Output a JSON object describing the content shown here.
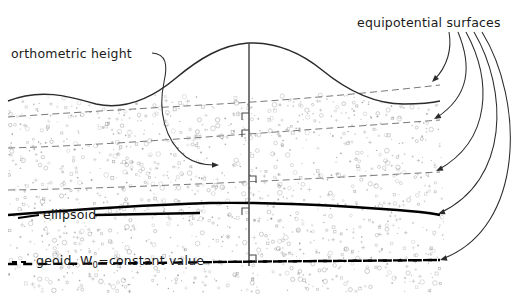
{
  "figure": {
    "kind": "geodesy-height-systems-diagram",
    "background_color": "#ffffff",
    "width": 531,
    "height": 296
  },
  "labels": {
    "equipotential": "equipotential surfaces",
    "orthometric": "orthometric height",
    "ellipsoid": "ellipsoid",
    "geoid_prefix": "geoid, W",
    "geoid_subscript": "0",
    "geoid_suffix": "=constant value"
  },
  "colors": {
    "terrain_stroke": "#2b2b2b",
    "equipotential_stroke": "#7a7a7a",
    "ellipsoid_stroke": "#000000",
    "geoid_stroke": "#000000",
    "leader_stroke": "#2b2b2b",
    "plumb_stroke": "#4a4a4a",
    "stipple": "#9a9a9a",
    "text": "#1a1a1a"
  },
  "surfaces": {
    "terrain_profile": "M 8,101 C 40,88 68,96 96,104 C 124,110 150,100 176,78 C 200,58 222,45 248,43 C 276,42 300,52 322,70 C 350,93 378,104 404,104 C 420,104 432,103 440,101",
    "equipotential_1": "M 8,117 C 80,112 150,108 220,104 C 290,100 360,94 440,85",
    "equipotential_2": "M 8,148 C 80,146 150,141 220,136 C 290,131 360,126 440,120",
    "equipotential_3": "M 8,190 C 80,189 150,186 220,183 C 290,180 360,176 440,172",
    "ellipsoid_path": "M 8,215 C 70,210 140,205 210,203 C 280,202 350,206 420,212 C 430,213 436,214 440,215",
    "geoid_path": "M 8,264 C 80,264 150,263 220,262 C 290,261 360,261 440,260",
    "plumb_line": "M 249,43 L 249,266"
  },
  "plumb_markers": [
    {
      "x": 249,
      "y": 120,
      "side": "left"
    },
    {
      "x": 249,
      "y": 137,
      "side": "left"
    },
    {
      "x": 249,
      "y": 183,
      "side": "right"
    },
    {
      "x": 249,
      "y": 215,
      "side": "left"
    },
    {
      "x": 249,
      "y": 262,
      "side": "right"
    }
  ],
  "leaders": [
    {
      "name": "equipotential-leader-1",
      "path": "M 449,32 C 452,48 448,66 434,80",
      "arrow_at": [
        432,
        82
      ],
      "angle": 135
    },
    {
      "name": "equipotential-leader-2",
      "path": "M 458,32 C 472,66 470,96 436,118",
      "arrow_at": [
        434,
        119
      ],
      "angle": 150
    },
    {
      "name": "equipotential-leader-3",
      "path": "M 466,32 C 492,80 492,140 438,170",
      "arrow_at": [
        436,
        171
      ],
      "angle": 155
    },
    {
      "name": "equipotential-leader-4",
      "path": "M 474,32 C 508,90 510,180 440,213",
      "arrow_at": [
        438,
        214
      ],
      "angle": 160
    },
    {
      "name": "equipotential-leader-5",
      "path": "M 482,32 C 524,100 526,228 442,259",
      "arrow_at": [
        440,
        260
      ],
      "angle": 163
    },
    {
      "name": "orthometric-leader",
      "path": "M 152,53 C 166,54 168,64 164,82 C 158,110 164,140 186,157 C 196,164 206,165 214,165",
      "arrow_at": [
        219,
        165
      ],
      "angle": 0
    }
  ],
  "label_positions": {
    "equipotential": {
      "x": 357,
      "y": 27
    },
    "orthometric": {
      "x": 11,
      "y": 58
    },
    "ellipsoid": {
      "x": 43,
      "y": 219
    },
    "geoid": {
      "x": 36,
      "y": 265
    }
  },
  "label_dashes": {
    "ellipsoid_tick": "M 18,218 L 39,215",
    "ellipsoid_tail": "M 95,215 L 200,213",
    "geoid_tick": "M 12,262 L 30,262",
    "geoid_tail": "M 213,262 L 440,260"
  },
  "stipple": {
    "seed": 20240617,
    "count": 1350,
    "region_top": 95,
    "region_bottom": 292,
    "region_left": 8,
    "region_right": 446,
    "glyphs": [
      "dot",
      "circle",
      "plus",
      "square"
    ]
  }
}
